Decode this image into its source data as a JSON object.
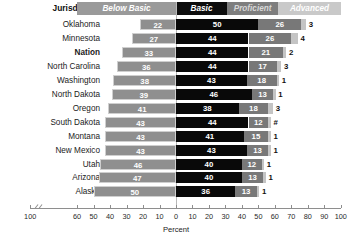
{
  "header": {
    "jurisdiction_label": "Jurisdiction"
  },
  "legend": [
    {
      "key": "below_basic",
      "label": "Below Basic"
    },
    {
      "key": "basic",
      "label": "Basic"
    },
    {
      "key": "proficient",
      "label": "Proficient"
    },
    {
      "key": "advanced",
      "label": "Advanced"
    }
  ],
  "colors": {
    "below_basic": "#8f8f8f",
    "basic": "#090909",
    "proficient": "#787878",
    "advanced": "#c4c4c4",
    "axis": "#8e8e8e",
    "zero_line": "#b9b9b9",
    "text": "#1b1b1b"
  },
  "axis": {
    "title": "Percent",
    "tick_labels": [
      "100",
      "60",
      "50",
      "40",
      "30",
      "20",
      "10",
      "0",
      "10",
      "20",
      "30",
      "40",
      "50",
      "60",
      "70",
      "80",
      "90",
      "100"
    ],
    "break_between": [
      "100",
      "60"
    ],
    "zero_at": "0"
  },
  "chart_data": {
    "type": "bar",
    "subtype": "diverging-stacked-bar",
    "title": "",
    "xlabel": "Percent",
    "ylabel": "Jurisdiction",
    "xlim": [
      -100,
      100
    ],
    "grid": false,
    "legend_position": "top",
    "categories": [
      "Oklahoma",
      "Minnesota",
      "Nation",
      "North Carolina",
      "Washington",
      "North Dakota",
      "Oregon",
      "South Dakota",
      "Montana",
      "New Mexico",
      "Utah",
      "Arizona",
      "Alaska"
    ],
    "series": [
      {
        "name": "Below Basic",
        "values": [
          22,
          27,
          33,
          36,
          38,
          39,
          41,
          43,
          43,
          43,
          46,
          47,
          50
        ]
      },
      {
        "name": "Basic",
        "values": [
          50,
          44,
          44,
          44,
          43,
          46,
          38,
          44,
          41,
          43,
          40,
          40,
          36
        ]
      },
      {
        "name": "Proficient",
        "values": [
          26,
          26,
          21,
          17,
          18,
          13,
          18,
          12,
          15,
          13,
          12,
          13,
          13
        ]
      },
      {
        "name": "Advanced",
        "values": [
          3,
          4,
          2,
          3,
          1,
          1,
          3,
          0,
          1,
          1,
          1,
          1,
          1
        ]
      }
    ],
    "rows": [
      {
        "jurisdiction": "Oklahoma",
        "bold": false,
        "below_basic": "22",
        "basic": "50",
        "proficient": "26",
        "advanced": "3"
      },
      {
        "jurisdiction": "Minnesota",
        "bold": false,
        "below_basic": "27",
        "basic": "44",
        "proficient": "26",
        "advanced": "4"
      },
      {
        "jurisdiction": "Nation",
        "bold": true,
        "below_basic": "33",
        "basic": "44",
        "proficient": "21",
        "advanced": "2"
      },
      {
        "jurisdiction": "North Carolina",
        "bold": false,
        "below_basic": "36",
        "basic": "44",
        "proficient": "17",
        "advanced": "3"
      },
      {
        "jurisdiction": "Washington",
        "bold": false,
        "below_basic": "38",
        "basic": "43",
        "proficient": "18",
        "advanced": "1"
      },
      {
        "jurisdiction": "North Dakota",
        "bold": false,
        "below_basic": "39",
        "basic": "46",
        "proficient": "13",
        "advanced": "1"
      },
      {
        "jurisdiction": "Oregon",
        "bold": false,
        "below_basic": "41",
        "basic": "38",
        "proficient": "18",
        "advanced": "3"
      },
      {
        "jurisdiction": "South Dakota",
        "bold": false,
        "below_basic": "43",
        "basic": "44",
        "proficient": "12",
        "advanced": "#"
      },
      {
        "jurisdiction": "Montana",
        "bold": false,
        "below_basic": "43",
        "basic": "41",
        "proficient": "15",
        "advanced": "1"
      },
      {
        "jurisdiction": "New Mexico",
        "bold": false,
        "below_basic": "43",
        "basic": "43",
        "proficient": "13",
        "advanced": "1"
      },
      {
        "jurisdiction": "Utah",
        "bold": false,
        "below_basic": "46",
        "basic": "40",
        "proficient": "12",
        "advanced": "1"
      },
      {
        "jurisdiction": "Arizona",
        "bold": false,
        "below_basic": "47",
        "basic": "40",
        "proficient": "13",
        "advanced": "1"
      },
      {
        "jurisdiction": "Alaska",
        "bold": false,
        "below_basic": "50",
        "basic": "36",
        "proficient": "13",
        "advanced": "1"
      }
    ]
  }
}
